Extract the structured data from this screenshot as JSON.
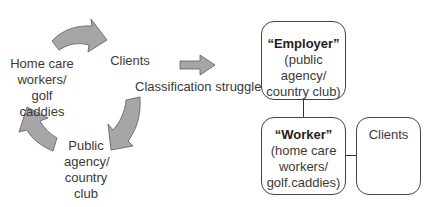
{
  "cycle": {
    "nodes": [
      {
        "id": "workers",
        "lines": [
          "Home care",
          "workers/",
          "golf caddies"
        ]
      },
      {
        "id": "clients",
        "lines": [
          "Clients"
        ]
      },
      {
        "id": "agency",
        "lines": [
          "Public",
          "agency/",
          "country",
          "club"
        ]
      }
    ],
    "arrows": [
      {
        "from": "workers",
        "to": "clients"
      },
      {
        "from": "clients",
        "to": "agency"
      },
      {
        "from": "agency",
        "to": "workers"
      }
    ]
  },
  "transition": {
    "label": "Classification struggle",
    "arrow_direction": "right"
  },
  "hierarchy": {
    "employer": {
      "title": "“Employer”",
      "lines": [
        "(public agency/",
        "country club)"
      ]
    },
    "worker": {
      "title": "“Worker”",
      "lines": [
        "(home care",
        "workers/",
        "golf.caddies)"
      ]
    },
    "clients": {
      "title": "Clients"
    }
  },
  "colors": {
    "arrow_fill": "#a6a6a6",
    "arrow_stroke": "#5a5a5a",
    "box_border": "#444444",
    "text": "#3a3a3a"
  }
}
